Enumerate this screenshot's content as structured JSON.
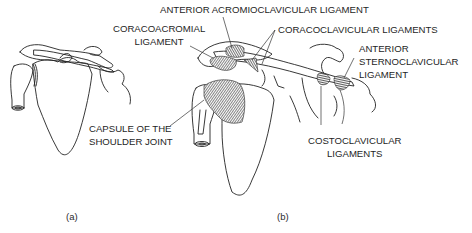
{
  "figure": {
    "panels": [
      {
        "id": "a",
        "caption": "(a)"
      },
      {
        "id": "b",
        "caption": "(b)"
      }
    ],
    "labels": {
      "anterior_acromioclavicular": [
        "ANTERIOR ACROMIOCLAVICULAR LIGAMENT"
      ],
      "coracoacromial": [
        "CORACOACROMIAL",
        "LIGAMENT"
      ],
      "coracoclavicular": [
        "CORACOCLAVICULAR LIGAMENTS"
      ],
      "anterior_sternoclavicular": [
        "ANTERIOR",
        "STERNOCLAVICULAR",
        "LIGAMENT"
      ],
      "capsule": [
        "CAPSULE OF THE",
        "SHOULDER JOINT"
      ],
      "costoclavicular": [
        "COSTOCLAVICULAR",
        "LIGAMENTS"
      ]
    },
    "colors": {
      "line": "#222222",
      "ligament_fill": "#3a3a3a",
      "text": "#1e1e1e",
      "background": "#ffffff"
    }
  }
}
